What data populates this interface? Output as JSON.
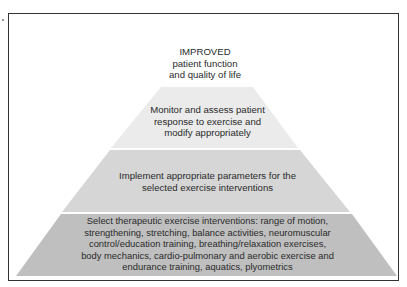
{
  "diagram": {
    "type": "pyramid",
    "apex": {
      "lines": [
        "IMPROVED",
        "patient function",
        "and quality of life"
      ]
    },
    "layers": [
      {
        "level": "top",
        "color": "#ebebeb",
        "lines": [
          "Monitor and assess patient",
          "response to exercise and",
          "modify appropriately"
        ]
      },
      {
        "level": "middle",
        "color": "#d6d6d6",
        "lines": [
          "Implement appropriate parameters for the",
          "selected exercise interventions"
        ]
      },
      {
        "level": "base",
        "color": "#bfbfbf",
        "lines": [
          "Select therapeutic exercise interventions:  range of motion,",
          "strengthening, stretching, balance activities, neuromuscular",
          "control/education training, breathing/relaxation exercises,",
          "body mechanics, cardio-pulmonary and aerobic exercise and",
          "endurance training, aquatics, plyometrics"
        ]
      }
    ],
    "frame_color": "#333333"
  }
}
